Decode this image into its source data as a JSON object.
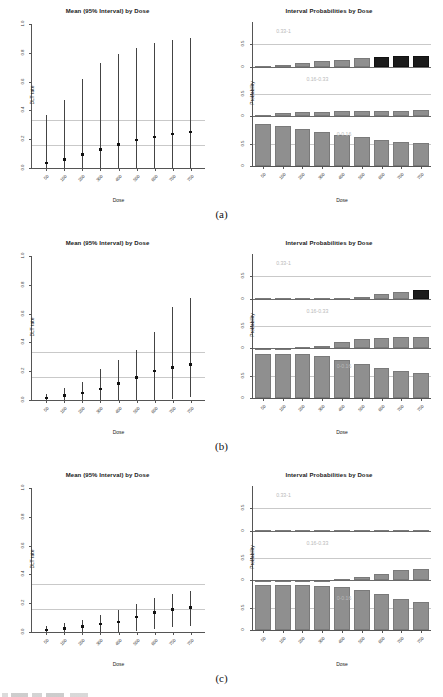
{
  "figure": {
    "width": 443,
    "height": 697,
    "panels": [
      "(a)",
      "(b)",
      "(c)"
    ],
    "dose_label": "Dose",
    "dlt_label": "DLT rate",
    "prob_label": "Probability",
    "left_title": "Mean (95% Interval) by Dose",
    "right_title": "Interval Probabilities by Dose",
    "colors": {
      "bar_gray": "#8f8f8f",
      "bar_dark": "#1b1b1b",
      "reference_line": "#c9c9c9",
      "axis": "#555555",
      "segment_label": "#b9b9b9"
    }
  },
  "chart_data": [
    {
      "type": "scatter",
      "panel": "(a)",
      "position": "left",
      "title": "Mean (95% Interval) by Dose",
      "xlabel": "Dose",
      "ylabel": "DLT rate",
      "x": [
        50,
        100,
        200,
        300,
        400,
        500,
        600,
        700,
        750
      ],
      "xticklabels": [
        "50",
        "100",
        "200",
        "300",
        "400",
        "500",
        "600",
        "700",
        "750"
      ],
      "yticklabels": [
        "0.0",
        "0.2",
        "0.4",
        "0.6",
        "0.8",
        "1.0"
      ],
      "ylim": [
        0,
        1
      ],
      "values": [
        0.035,
        0.06,
        0.095,
        0.13,
        0.165,
        0.195,
        0.215,
        0.235,
        0.25
      ],
      "lower": [
        0.0,
        0.0,
        0.0,
        0.0,
        0.0,
        0.0,
        0.0,
        0.0,
        0.0
      ],
      "upper": [
        0.37,
        0.47,
        0.62,
        0.73,
        0.79,
        0.83,
        0.87,
        0.89,
        0.9
      ],
      "reference_lines": [
        0.16,
        0.33
      ],
      "grid": false
    },
    {
      "type": "bar",
      "panel": "(a)",
      "position": "right",
      "title": "Interval Probabilities by Dose",
      "xlabel": "Dose",
      "ylabel": "Probability",
      "categories": [
        "50",
        "100",
        "200",
        "300",
        "400",
        "500",
        "600",
        "700",
        "750"
      ],
      "yticklabels": [
        "0",
        "0.5",
        "0",
        "0.5",
        "0",
        "0.5"
      ],
      "ylim": [
        0,
        1
      ],
      "segments": [
        {
          "name": "0.33-1",
          "values": [
            0.015,
            0.04,
            0.09,
            0.12,
            0.155,
            0.19,
            0.22,
            0.235,
            0.245
          ],
          "highlight": [
            false,
            false,
            false,
            false,
            false,
            false,
            true,
            true,
            true
          ]
        },
        {
          "name": "0.16-0.33",
          "values": [
            0.04,
            0.07,
            0.09,
            0.105,
            0.115,
            0.12,
            0.125,
            0.13,
            0.135
          ],
          "highlight": [
            false,
            false,
            false,
            false,
            false,
            false,
            false,
            false,
            false
          ]
        },
        {
          "name": "0-0.16",
          "values": [
            0.945,
            0.89,
            0.82,
            0.755,
            0.695,
            0.645,
            0.59,
            0.545,
            0.52
          ],
          "highlight": [
            false,
            false,
            false,
            false,
            false,
            false,
            false,
            false,
            false
          ]
        }
      ]
    },
    {
      "type": "scatter",
      "panel": "(b)",
      "position": "left",
      "title": "Mean (95% Interval) by Dose",
      "xlabel": "Dose",
      "ylabel": "DLT rate",
      "x": [
        50,
        100,
        200,
        300,
        400,
        500,
        600,
        700,
        750
      ],
      "xticklabels": [
        "50",
        "100",
        "200",
        "300",
        "400",
        "500",
        "600",
        "700",
        "750"
      ],
      "yticklabels": [
        "0.0",
        "0.2",
        "0.4",
        "0.6",
        "0.8",
        "1.0"
      ],
      "ylim": [
        0,
        1
      ],
      "values": [
        0.015,
        0.03,
        0.05,
        0.075,
        0.115,
        0.155,
        0.2,
        0.225,
        0.245
      ],
      "lower": [
        0.0,
        0.0,
        0.0,
        0.0,
        0.0,
        0.0,
        0.0,
        0.01,
        0.02
      ],
      "upper": [
        0.045,
        0.08,
        0.125,
        0.215,
        0.275,
        0.345,
        0.47,
        0.645,
        0.71
      ],
      "reference_lines": [
        0.16,
        0.33
      ],
      "grid": false
    },
    {
      "type": "bar",
      "panel": "(b)",
      "position": "right",
      "title": "Interval Probabilities by Dose",
      "xlabel": "Dose",
      "ylabel": "Probability",
      "categories": [
        "50",
        "100",
        "200",
        "300",
        "400",
        "500",
        "600",
        "700",
        "750"
      ],
      "yticklabels": [
        "0",
        "0.5",
        "0",
        "0.5",
        "0",
        "0.5"
      ],
      "ylim": [
        0,
        1
      ],
      "segments": [
        {
          "name": "0.33-1",
          "values": [
            0.0,
            0.0,
            0.0,
            0.005,
            0.01,
            0.04,
            0.095,
            0.145,
            0.185
          ],
          "highlight": [
            false,
            false,
            false,
            false,
            false,
            false,
            false,
            false,
            true
          ]
        },
        {
          "name": "0.16-0.33",
          "values": [
            0.005,
            0.01,
            0.02,
            0.055,
            0.135,
            0.205,
            0.24,
            0.245,
            0.245
          ],
          "highlight": [
            false,
            false,
            false,
            false,
            false,
            false,
            false,
            false,
            false
          ]
        },
        {
          "name": "0-0.16",
          "values": [
            0.995,
            0.99,
            0.975,
            0.935,
            0.855,
            0.755,
            0.665,
            0.61,
            0.57
          ],
          "highlight": [
            false,
            false,
            false,
            false,
            false,
            false,
            false,
            false,
            false
          ]
        }
      ]
    },
    {
      "type": "scatter",
      "panel": "(c)",
      "position": "left",
      "title": "Mean (95% Interval) by Dose",
      "xlabel": "Dose",
      "ylabel": "DLT rate",
      "x": [
        50,
        100,
        200,
        300,
        400,
        500,
        600,
        700,
        750
      ],
      "xticklabels": [
        "50",
        "100",
        "200",
        "300",
        "400",
        "500",
        "600",
        "750"
      ],
      "yticklabels": [
        "0.0",
        "0.2",
        "0.4",
        "0.6",
        "0.8",
        "1.0"
      ],
      "ylim": [
        0,
        1
      ],
      "values": [
        0.015,
        0.025,
        0.04,
        0.055,
        0.07,
        0.105,
        0.135,
        0.155,
        0.17
      ],
      "lower": [
        0.0,
        0.0,
        0.0,
        0.0,
        0.0,
        0.005,
        0.02,
        0.035,
        0.045
      ],
      "upper": [
        0.045,
        0.06,
        0.085,
        0.115,
        0.155,
        0.195,
        0.235,
        0.265,
        0.285
      ],
      "reference_lines": [
        0.16,
        0.33
      ],
      "grid": false
    },
    {
      "type": "bar",
      "panel": "(c)",
      "position": "right",
      "title": "Interval Probabilities by Dose",
      "xlabel": "Dose",
      "ylabel": "Probability",
      "categories": [
        "50",
        "100",
        "200",
        "300",
        "400",
        "500",
        "600",
        "700",
        "750"
      ],
      "yticklabels": [
        "0",
        "0.5",
        "0",
        "0.5",
        "0",
        "0.5"
      ],
      "ylim": [
        0,
        1
      ],
      "segments": [
        {
          "name": "0.33-1",
          "values": [
            0.0,
            0.0,
            0.0,
            0.0,
            0.0,
            0.0,
            0.0,
            0.01,
            0.015
          ],
          "highlight": [
            false,
            false,
            false,
            false,
            false,
            false,
            false,
            false,
            false
          ]
        },
        {
          "name": "0.16-0.33",
          "values": [
            0.0,
            0.0,
            0.0,
            0.005,
            0.035,
            0.085,
            0.15,
            0.225,
            0.26
          ],
          "highlight": [
            false,
            false,
            false,
            false,
            false,
            false,
            false,
            false,
            false
          ]
        },
        {
          "name": "0-0.16",
          "values": [
            1.0,
            1.0,
            1.0,
            0.995,
            0.96,
            0.9,
            0.8,
            0.695,
            0.625
          ],
          "highlight": [
            false,
            false,
            false,
            false,
            false,
            false,
            false,
            false,
            false
          ]
        }
      ]
    }
  ]
}
